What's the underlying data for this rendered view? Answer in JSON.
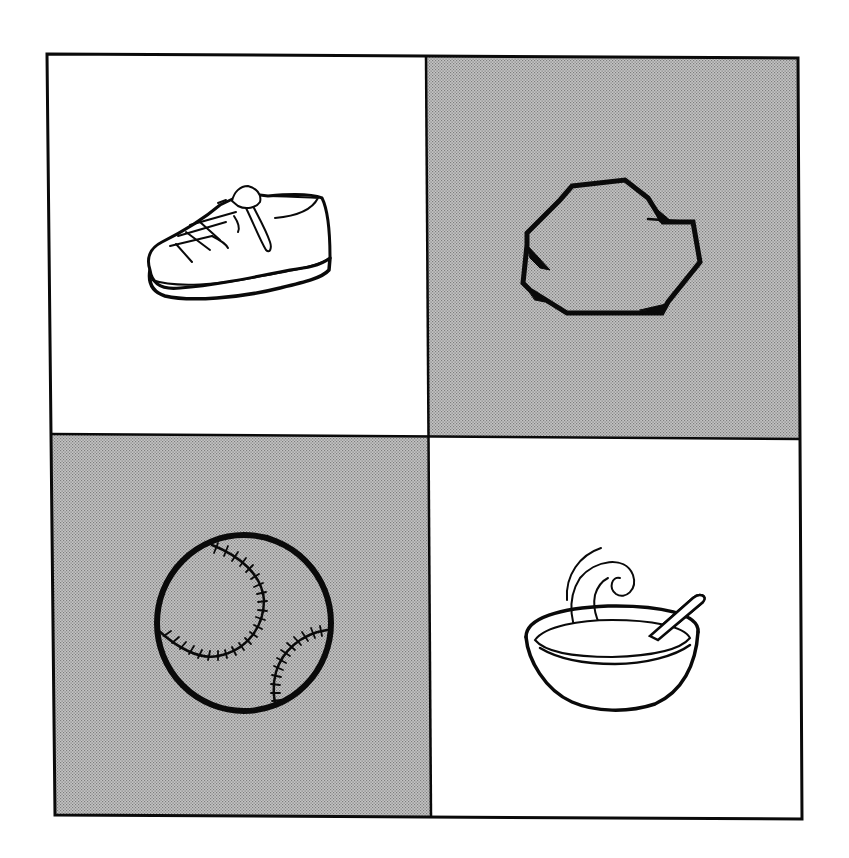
{
  "worksheet": {
    "layout": "2x2 picture grid",
    "colors": {
      "background": "#ffffff",
      "ink": "#0a0a0a",
      "shade": "#b9b9b9",
      "shade_dot": "#8c8c8c"
    },
    "cells": [
      {
        "position": "top-left",
        "picture": "shoe",
        "shaded": false
      },
      {
        "position": "top-right",
        "picture": "rock",
        "shaded": true
      },
      {
        "position": "bottom-left",
        "picture": "baseball",
        "shaded": true
      },
      {
        "position": "bottom-right",
        "picture": "soup-bowl",
        "shaded": false
      }
    ]
  }
}
